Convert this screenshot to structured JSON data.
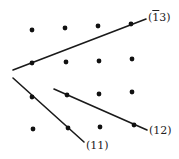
{
  "diagram": {
    "title": "",
    "colors": {
      "dot": "#111111",
      "line": "#1a1a1a",
      "label": "#222222",
      "background": "#ffffff"
    },
    "points": [
      {
        "x": 32,
        "y": 30
      },
      {
        "x": 65,
        "y": 28
      },
      {
        "x": 98,
        "y": 26
      },
      {
        "x": 131,
        "y": 24
      },
      {
        "x": 32,
        "y": 63
      },
      {
        "x": 66,
        "y": 62
      },
      {
        "x": 99,
        "y": 61
      },
      {
        "x": 132,
        "y": 59
      },
      {
        "x": 32,
        "y": 97
      },
      {
        "x": 67,
        "y": 95
      },
      {
        "x": 99,
        "y": 94
      },
      {
        "x": 132,
        "y": 92
      },
      {
        "x": 33,
        "y": 129
      },
      {
        "x": 68,
        "y": 128
      },
      {
        "x": 100,
        "y": 127
      },
      {
        "x": 134,
        "y": 125
      }
    ],
    "lines": [
      {
        "id": "line-13bar",
        "label_prefix": "(",
        "label_bar": "1",
        "label_rest": "3)",
        "label_text": "(1̄3)",
        "x1": 13,
        "y1": 70,
        "x2": 146,
        "y2": 19,
        "label_x": 148,
        "label_y": 12
      },
      {
        "id": "line-11",
        "label_text": "(11)",
        "x1": 13,
        "y1": 78,
        "x2": 84,
        "y2": 142,
        "label_x": 86,
        "label_y": 140
      },
      {
        "id": "line-12",
        "label_text": "(12)",
        "x1": 54,
        "y1": 89,
        "x2": 147,
        "y2": 130,
        "label_x": 149,
        "label_y": 125
      }
    ]
  }
}
